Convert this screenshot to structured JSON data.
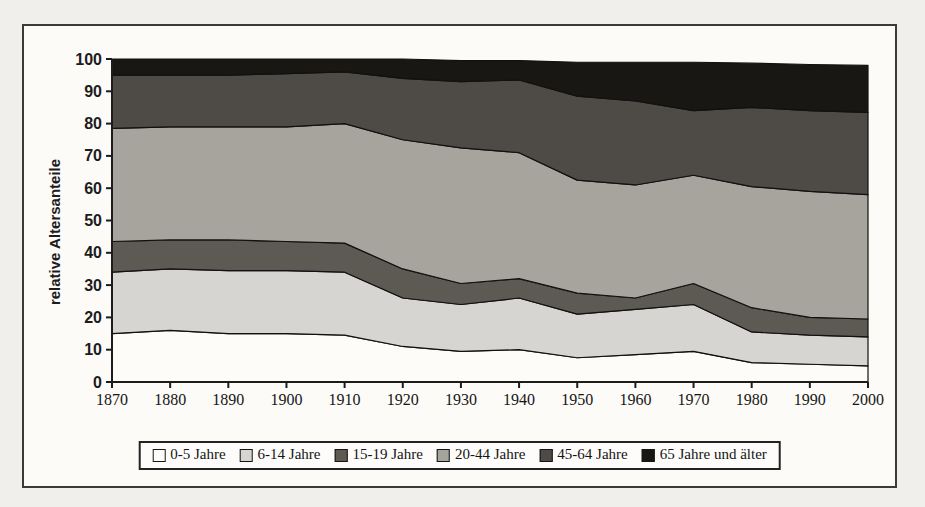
{
  "figure": {
    "background": "#fcfbf8",
    "frame_color": "#3a3a3a",
    "page_background": "#f1efeb"
  },
  "chart_data": {
    "type": "area",
    "stacked": true,
    "title": "",
    "xlabel": "",
    "ylabel": "relative Altersanteile",
    "ylim": [
      0,
      100
    ],
    "y_tick_step": 10,
    "y_ticks": [
      "0",
      "10",
      "20",
      "30",
      "40",
      "50",
      "60",
      "70",
      "80",
      "90",
      "100"
    ],
    "grid": false,
    "legend_position": "bottom",
    "axis_color": "#1c1c1c",
    "boundary_line_color": "#111111",
    "categories": [
      "1870",
      "1880",
      "1890",
      "1900",
      "1910",
      "1920",
      "1930",
      "1940",
      "1950",
      "1960",
      "1970",
      "1980",
      "1990",
      "2000"
    ],
    "series": [
      {
        "name": "0-5 Jahre",
        "color": "#fdfcf9",
        "values": [
          15.0,
          16.0,
          15.0,
          15.0,
          14.5,
          11.0,
          9.5,
          10.0,
          7.5,
          8.5,
          9.5,
          6.0,
          5.5,
          5.0
        ]
      },
      {
        "name": "6-14 Jahre",
        "color": "#d7d5d1",
        "values": [
          19.0,
          19.0,
          19.5,
          19.5,
          19.5,
          15.0,
          14.5,
          16.0,
          13.5,
          14.0,
          14.5,
          9.5,
          9.0,
          9.0
        ]
      },
      {
        "name": "15-19 Jahre",
        "color": "#5d5a54",
        "values": [
          9.5,
          9.0,
          9.5,
          9.0,
          9.0,
          9.0,
          6.5,
          6.0,
          6.5,
          3.5,
          6.5,
          7.5,
          5.5,
          5.5
        ]
      },
      {
        "name": "20-44 Jahre",
        "color": "#a7a49e",
        "values": [
          35.0,
          35.0,
          35.0,
          35.5,
          37.0,
          40.0,
          42.0,
          39.0,
          35.0,
          35.0,
          33.5,
          37.5,
          39.0,
          38.5
        ]
      },
      {
        "name": "45-64 Jahre",
        "color": "#4e4b46",
        "values": [
          16.5,
          16.0,
          16.0,
          16.5,
          16.0,
          19.0,
          20.5,
          22.5,
          26.0,
          26.0,
          20.0,
          24.5,
          25.0,
          25.5
        ]
      },
      {
        "name": "65 Jahre und älter",
        "color": "#191713",
        "values": [
          5.0,
          5.0,
          5.0,
          4.5,
          4.0,
          6.0,
          6.5,
          6.0,
          10.5,
          12.0,
          15.0,
          13.7,
          14.3,
          14.5
        ]
      }
    ]
  }
}
